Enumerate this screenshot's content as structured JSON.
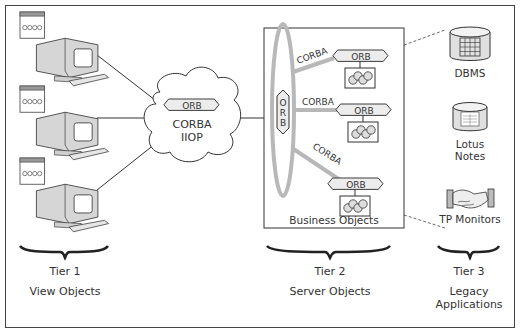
{
  "diagram": {
    "cloud": {
      "orb_label": "ORB",
      "line1": "CORBA",
      "line2": "IIOP"
    },
    "server_box": {
      "bus_label": "ORB",
      "links": [
        {
          "label": "CORBA"
        },
        {
          "label": "CORBA"
        },
        {
          "label": "CORBA"
        }
      ],
      "objects": [
        {
          "orb_label": "ORB"
        },
        {
          "orb_label": "ORB"
        },
        {
          "orb_label": "ORB"
        }
      ],
      "caption": "Business Objects"
    },
    "legacy": {
      "items": [
        {
          "label": "DBMS",
          "icon": "database-icon"
        },
        {
          "label_line1": "Lotus",
          "label_line2": "Notes",
          "icon": "document-database-icon"
        },
        {
          "label": "TP Monitors",
          "icon": "handshake-icon"
        }
      ]
    },
    "clients": [
      {
        "icon": "computer-terminal-icon"
      },
      {
        "icon": "computer-terminal-icon"
      },
      {
        "icon": "computer-terminal-icon"
      }
    ],
    "tiers": [
      {
        "name": "Tier 1",
        "description": "View Objects"
      },
      {
        "name": "Tier 2",
        "description": "Server Objects"
      },
      {
        "name": "Tier 3",
        "description_line1": "Legacy",
        "description_line2": "Applications"
      }
    ]
  },
  "colors": {
    "line": "#333333",
    "bus": "#b8b8b8",
    "fill_light": "#e8e8e8"
  }
}
